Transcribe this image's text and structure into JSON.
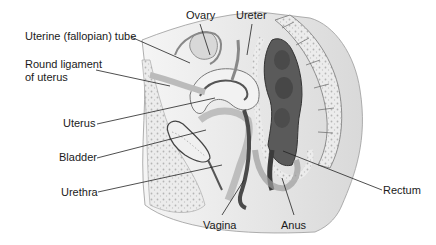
{
  "diagram": {
    "labels": [
      {
        "id": "ovary",
        "text": "Ovary",
        "x": 186,
        "y": 9
      },
      {
        "id": "ureter",
        "text": "Ureter",
        "x": 236,
        "y": 9
      },
      {
        "id": "uterine-tube",
        "text": "Uterine (fallopian) tube",
        "x": 25,
        "y": 30
      },
      {
        "id": "round-ligament",
        "text": "Round ligament\nof uterus",
        "x": 25,
        "y": 58
      },
      {
        "id": "uterus",
        "text": "Uterus",
        "x": 63,
        "y": 117
      },
      {
        "id": "bladder",
        "text": "Bladder",
        "x": 59,
        "y": 151
      },
      {
        "id": "urethra",
        "text": "Urethra",
        "x": 61,
        "y": 186
      },
      {
        "id": "rectum",
        "text": "Rectum",
        "x": 383,
        "y": 184
      },
      {
        "id": "vagina",
        "text": "Vagina",
        "x": 203,
        "y": 219
      },
      {
        "id": "anus",
        "text": "Anus",
        "x": 281,
        "y": 219
      }
    ],
    "colors": {
      "background": "#ffffff",
      "label_text": "#1a1a1a",
      "leader_line": "#222222",
      "tissue_light": "#e6e6e6",
      "tissue_mid": "#bdbdbd",
      "tissue_dark": "#6e6e6e",
      "cavity_dark": "#3c3c3c"
    }
  }
}
